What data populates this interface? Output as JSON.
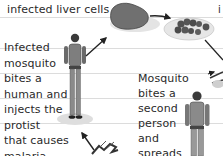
{
  "diagram": {
    "title_fragment": "infected liver cells",
    "corner_fragment": "i",
    "steps": [
      {
        "id": "bite-first",
        "lines": [
          "Infected",
          "mosquito",
          "bites a",
          "human and",
          "injects the",
          "protist",
          "that causes",
          "malaria."
        ]
      },
      {
        "id": "bite-second",
        "lines": [
          "Mosquito",
          "bites a",
          "second",
          "person",
          "and",
          "spreads"
        ]
      }
    ],
    "icons": [
      "liver-icon",
      "infected-cells-dish-icon",
      "person-icon",
      "person-icon",
      "mosquito-icon",
      "arrow-icon"
    ],
    "colors": {
      "background": "#ffffff",
      "text": "#2a2a2a",
      "art_dark": "#3a3a3a",
      "art_mid": "#7a7a7a",
      "art_light": "#d9d9d9",
      "rule": "#dcdcdc"
    }
  }
}
